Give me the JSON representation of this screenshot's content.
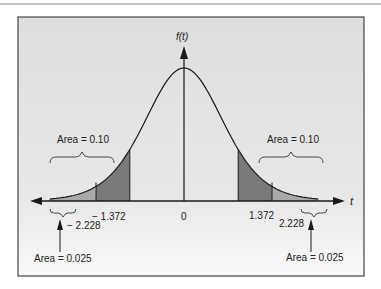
{
  "figure": {
    "y_axis_label": "f(t)",
    "x_axis_label": "t",
    "origin_label": "0",
    "tick_labels": {
      "neg_inner": "− 1.372",
      "neg_outer": "− 2.228",
      "pos_inner": "1.372",
      "pos_outer": "2.228"
    },
    "annotations": {
      "left_upper": "Area = 0.10",
      "right_upper": "Area = 0.10",
      "left_lower": "Area = 0.025",
      "right_lower": "Area = 0.025"
    },
    "colors": {
      "background": "#e4e4e4",
      "dark_shade": "#7a7a7a",
      "light_shade": "#a8a8a8",
      "line": "#1a1a1a"
    }
  },
  "chart_data": {
    "type": "area",
    "title": "",
    "xlabel": "t",
    "ylabel": "f(t)",
    "critical_values": [
      -2.228,
      -1.372,
      0,
      1.372,
      2.228
    ],
    "shaded_regions": [
      {
        "range": [
          "-inf",
          -1.372
        ],
        "area": 0.1
      },
      {
        "range": [
          "-inf",
          -2.228
        ],
        "area": 0.025
      },
      {
        "range": [
          1.372,
          "inf"
        ],
        "area": 0.1
      },
      {
        "range": [
          2.228,
          "inf"
        ],
        "area": 0.025
      }
    ],
    "grid": false
  }
}
